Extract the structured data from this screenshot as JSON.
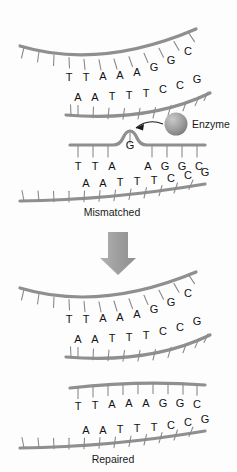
{
  "figure": {
    "background_color": "#fdfdfd",
    "strand_color": "#8f8f8f",
    "tick_color": "#8a8a8a",
    "text_color": "#111111",
    "arrow_color": "#9a9a9a",
    "enzyme_color": "#9b9b9b"
  },
  "panels": [
    {
      "id": "normal",
      "label": "",
      "top_strand": {
        "bases": [
          "T",
          "T",
          "A",
          "A",
          "A",
          "G",
          "G",
          "C"
        ],
        "tick_count": 12
      },
      "bottom_strand": {
        "bases": [
          "A",
          "A",
          "T",
          "T",
          "T",
          "C",
          "C",
          "G"
        ],
        "tick_count": 11
      }
    },
    {
      "id": "mismatched",
      "label": "Mismatched",
      "top_strand": {
        "bases": [
          "T",
          "T",
          "A",
          "G",
          "A",
          "G",
          "G",
          "C"
        ],
        "bulge_base": "G",
        "bulge_index": 3,
        "tick_count": 12
      },
      "bottom_strand": {
        "bases": [
          "A",
          "A",
          "T",
          "T",
          "T",
          "C",
          "C",
          "G"
        ],
        "tick_count": 11
      }
    },
    {
      "id": "repaired",
      "label": "Repaired",
      "top_strand": {
        "bases": [
          "T",
          "T",
          "A",
          "A",
          "A",
          "G",
          "G",
          "C"
        ],
        "tick_count": 12
      },
      "bottom_strand": {
        "bases": [
          "A",
          "A",
          "T",
          "T",
          "T",
          "C",
          "C",
          "G"
        ],
        "tick_count": 11
      }
    }
  ],
  "annotations": {
    "enzyme_label": "Enzyme",
    "process_arrow": "down-arrow"
  }
}
